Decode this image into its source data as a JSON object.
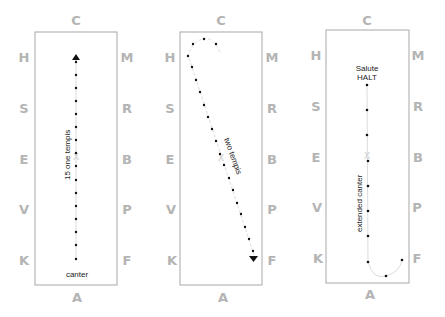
{
  "colors": {
    "arena_border": "#a8a8a8",
    "letters": "#b4b4b4",
    "path_dots": "#111111",
    "path_line": "#dcdcdc",
    "text": "#222222"
  },
  "arenas": [
    {
      "id": "arena-1",
      "letters": {
        "top": "C",
        "bottom": "A",
        "left": [
          "H",
          "S",
          "E",
          "V",
          "K"
        ],
        "right": [
          "M",
          "R",
          "B",
          "P",
          "F"
        ],
        "center": "X"
      },
      "labels": {
        "movement": "15 one tempis",
        "gait": "canter"
      }
    },
    {
      "id": "arena-2",
      "letters": {
        "top": "C",
        "bottom": "A",
        "left": [
          "H",
          "S",
          "E",
          "V",
          "K"
        ],
        "right": [
          "M",
          "R",
          "B",
          "P",
          "F"
        ],
        "center": "X"
      },
      "labels": {
        "movement": "two tempis"
      }
    },
    {
      "id": "arena-3",
      "letters": {
        "top": "C",
        "bottom": "A",
        "left": [
          "H",
          "S",
          "E",
          "V",
          "K"
        ],
        "right": [
          "M",
          "R",
          "B",
          "P",
          "F"
        ],
        "center": "X"
      },
      "labels": {
        "halt_line1": "Salute",
        "halt_line2": "HALT",
        "movement": "extended canter"
      }
    }
  ]
}
